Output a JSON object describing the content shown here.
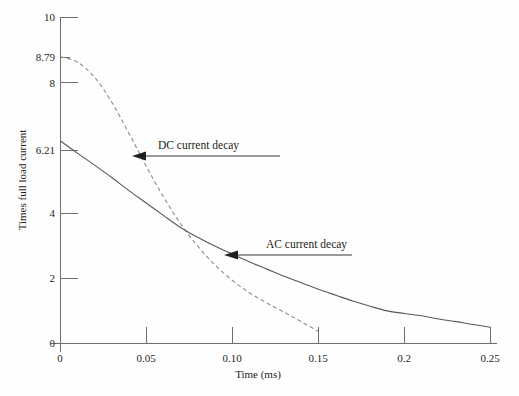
{
  "chart_data": {
    "type": "line",
    "title": "",
    "xlabel": "Time (ms)",
    "ylabel": "Times full load current",
    "xlim": [
      0,
      0.25
    ],
    "ylim": [
      0,
      10
    ],
    "grid": false,
    "legend_position": "inline-annotations",
    "xticks": [
      0,
      0.05,
      0.1,
      0.15,
      0.2,
      0.25
    ],
    "xtick_labels": [
      "0",
      "0.05",
      "0.10",
      "0.15",
      "0.2",
      "0.25"
    ],
    "yticks": [
      0,
      2,
      4,
      6.21,
      8,
      8.79,
      10
    ],
    "ytick_labels": [
      "0",
      "2",
      "4",
      "6.21",
      "8",
      "8.79",
      "10"
    ],
    "annotations": [
      {
        "text": "DC current decay",
        "points_to_series": "DC current decay",
        "at_x": 0.045,
        "at_y": 6.05
      },
      {
        "text": "AC current decay",
        "points_to_series": "AC current decay",
        "at_x": 0.112,
        "at_y": 2.9
      }
    ],
    "series": [
      {
        "name": "DC current decay",
        "style": "dashed",
        "color": "#8c8c8f",
        "start_value": 8.79,
        "end_time": 0.15,
        "end_value": 0.37,
        "x": [
          0,
          0.01,
          0.02,
          0.03,
          0.04,
          0.05,
          0.06,
          0.07,
          0.08,
          0.09,
          0.1,
          0.11,
          0.12,
          0.13,
          0.14,
          0.15
        ],
        "values": [
          8.79,
          8.62,
          8.15,
          7.38,
          6.42,
          5.42,
          4.48,
          3.66,
          2.97,
          2.4,
          1.93,
          1.55,
          1.24,
          0.96,
          0.67,
          0.37
        ]
      },
      {
        "name": "AC current decay",
        "style": "solid",
        "color": "#58585b",
        "start_value": 6.21,
        "end_time": 0.25,
        "end_value": 0.5,
        "x": [
          0,
          0.01,
          0.02,
          0.03,
          0.04,
          0.05,
          0.06,
          0.07,
          0.08,
          0.09,
          0.1,
          0.11,
          0.12,
          0.13,
          0.14,
          0.15,
          0.16,
          0.17,
          0.18,
          0.19,
          0.2,
          0.21,
          0.22,
          0.23,
          0.24,
          0.25
        ],
        "values": [
          6.21,
          5.83,
          5.46,
          5.08,
          4.68,
          4.3,
          3.92,
          3.55,
          3.25,
          2.98,
          2.74,
          2.5,
          2.28,
          2.06,
          1.86,
          1.66,
          1.48,
          1.3,
          1.14,
          1.0,
          0.92,
          0.85,
          0.75,
          0.67,
          0.58,
          0.5
        ]
      }
    ],
    "crossover": {
      "x": 0.068,
      "y": 3.6
    }
  }
}
